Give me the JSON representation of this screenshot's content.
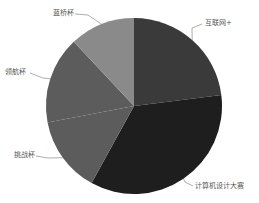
{
  "chart_data": {
    "type": "pie",
    "title": "",
    "legend": "none (labels with leader lines)",
    "categories": [
      "互联网+",
      "计算机设计大赛",
      "挑战杯",
      "领航杯",
      "蓝桥杯"
    ],
    "values": [
      23,
      35,
      14,
      16,
      12
    ],
    "values_are_estimates": true,
    "colors": [
      "#3a3a3a",
      "#1e1e1e",
      "#5c5c5c",
      "#5c5c5c",
      "#8a8a8a"
    ],
    "center": [
      134,
      106
    ],
    "radius": 88
  },
  "labels": {
    "internet_plus": "互联网+",
    "computer_design": "计算机设计大赛",
    "challenge_cup": "挑战杯",
    "pilot_cup": "领航杯",
    "lanqiao_cup": "蓝桥杯"
  }
}
